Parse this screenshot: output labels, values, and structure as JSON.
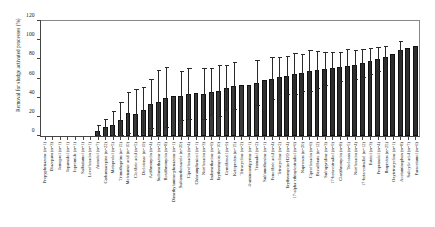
{
  "chart_data": {
    "type": "bar",
    "title": "",
    "xlabel": "",
    "ylabel": "Removal for sludge activated processes (%)",
    "ylim": [
      0,
      120
    ],
    "yticks": [
      0,
      20,
      40,
      60,
      80,
      100,
      120
    ],
    "grid": false,
    "legend": null,
    "orientation": "vertical",
    "error_bars": "standard deviation",
    "categories": [
      "Propyphenazone (n=1)",
      "Diazepam (n=3)",
      "Iomeprol (n=1)",
      "Iopamidol (n=1)",
      "Iopromide (n=1)",
      "Salbutamol (n=1)",
      "Levofloxacin (n=1)",
      "Atenolol (n=7)",
      "Carbamazepine (n=22)",
      "Metoprolol (n=5)",
      "Trimethoprim (n=15)",
      "Mefenamic acid (n=10)",
      "Clofibric acid (n=5)",
      "Diclofenac (n=19)",
      "Azithromycin (n=4)",
      "Sulfamethazine (n=2)",
      "Roxithromycin (n=8)",
      "Dimethylamino-phenazone (n=1)",
      "Sulfamethoxazole (n=20)",
      "Ciprofloxacin (n=4)",
      "Chloramphenicol (n=1)",
      "Norfloxacin (n=3)",
      "Indomethacine (n=6)",
      "Erythromycin (n=10)",
      "Gemfibrozil (n=9)",
      "Ketoprofen (n=15)",
      "Tetracycline (n=2)",
      "4-aminoantipyrine (n=1)",
      "Tramadol (n=2)",
      "Sulfamethoxine (n=1)",
      "Fenofibric acid (n=4)",
      "Tetracycline (n=2)",
      "Erythromycin-H2O (n=4)",
      "17-alpha-ethinylestradiol (n=6)",
      "Naproxen (n=20)",
      "Ciprofloxacin (n=6)",
      "Bezafibrate (n=12)",
      "Sulfapyridine (n=3)",
      "17-beta-estradiol (n=9)",
      "Clarithromycin (n=8)",
      "Triclosan (n=5)",
      "Norfloxacin (n=4)",
      "17-beta-estradiol (n=12)",
      "Estriol (n=3)",
      "Propranolol (n=4)",
      "Ibuprofen (n=25)",
      "Oxytetracycline (n=1)",
      "Acetaminophen (n=8)",
      "Salicylic acid (n=7)",
      "Paracetamol (n=6)"
    ],
    "values": [
      0,
      0,
      0,
      0,
      0,
      0,
      0,
      5,
      9,
      12,
      17,
      24,
      23,
      27,
      33,
      36,
      40,
      42,
      42,
      44,
      45,
      44,
      46,
      47,
      50,
      52,
      53,
      53,
      55,
      58,
      60,
      62,
      63,
      65,
      66,
      68,
      69,
      70,
      71,
      72,
      73,
      74,
      76,
      78,
      80,
      82,
      86,
      90,
      92,
      94
    ],
    "errors": [
      0,
      0,
      0,
      0,
      0,
      0,
      0,
      6,
      9,
      14,
      18,
      22,
      26,
      24,
      26,
      33,
      32,
      0,
      26,
      27,
      0,
      27,
      25,
      27,
      24,
      25,
      0,
      0,
      24,
      0,
      22,
      20,
      20,
      22,
      20,
      22,
      20,
      18,
      17,
      16,
      18,
      16,
      15,
      14,
      13,
      12,
      0,
      9,
      0,
      0
    ]
  },
  "axes": {
    "y_tick_labels": [
      "0",
      "20",
      "40",
      "60",
      "80",
      "100",
      "120"
    ]
  },
  "colors": {
    "bar_fill": "#3a3a3a",
    "bar_edge": "#111111",
    "error_bar": "#2a2a2a",
    "axis": "#444444",
    "text": "#1a1a1a",
    "background": "#ffffff"
  }
}
